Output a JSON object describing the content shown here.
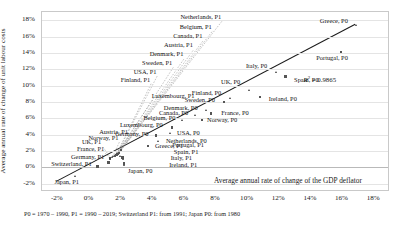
{
  "chart_data": {
    "type": "scatter",
    "title": "",
    "xlabel": "Average annual rate of change of the GDP deflator",
    "ylabel": "Average annual rate of change of unit labour costs",
    "xlim": [
      -3,
      19
    ],
    "ylim": [
      -3,
      19
    ],
    "xticks": [
      "-2%",
      "0%",
      "2%",
      "4%",
      "6%",
      "8%",
      "10%",
      "12%",
      "14%",
      "16%",
      "18%"
    ],
    "xtick_values": [
      -2,
      0,
      2,
      4,
      6,
      8,
      10,
      12,
      14,
      16,
      18
    ],
    "yticks": [
      "-2%",
      "0%",
      "2%",
      "4%",
      "6%",
      "8%",
      "10%",
      "12%",
      "14%",
      "16%",
      "18%"
    ],
    "ytick_values": [
      -2,
      0,
      2,
      4,
      6,
      8,
      10,
      12,
      14,
      16,
      18
    ],
    "grid": true,
    "legend": "none",
    "annotations": {
      "r_squared_label": "R",
      "r_squared_exp": "2",
      "r_squared_value": " = 0.9865"
    },
    "trendline": {
      "x0": -2.1,
      "y0": -1.7,
      "x1": 16.8,
      "y1": 17.5
    },
    "points": [
      {
        "label": "Greece, P0",
        "x": 16.9,
        "y": 17.4,
        "lx": 16.4,
        "ly": 17.8,
        "align": "right"
      },
      {
        "label": "Portugal, P0",
        "x": 15.9,
        "y": 14.1,
        "lx": 16.4,
        "ly": 13.3,
        "align": "right"
      },
      {
        "label": "Italy, P0",
        "x": 11.8,
        "y": 11.6,
        "lx": 11.3,
        "ly": 12.3,
        "align": "right"
      },
      {
        "label": "Spain, P0",
        "x": 12.4,
        "y": 11.1,
        "lx": 13.0,
        "ly": 10.6,
        "align": "left"
      },
      {
        "label": "UK, P0",
        "x": 10.1,
        "y": 9.4,
        "lx": 9.6,
        "ly": 10.3,
        "align": "right"
      },
      {
        "label": "Ireland, P0",
        "x": 10.8,
        "y": 8.6,
        "lx": 11.4,
        "ly": 8.2,
        "align": "left"
      },
      {
        "label": "Finland, P0",
        "x": 8.9,
        "y": 8.4,
        "lx": 8.4,
        "ly": 9.0,
        "align": "right"
      },
      {
        "label": "Sweden, P0",
        "x": 8.5,
        "y": 8.0,
        "lx": 8.0,
        "ly": 8.1,
        "align": "right"
      },
      {
        "label": "Denmark, P0",
        "x": 7.4,
        "y": 7.0,
        "lx": 6.9,
        "ly": 7.2,
        "align": "right"
      },
      {
        "label": "France, P0",
        "x": 7.7,
        "y": 6.6,
        "lx": 8.4,
        "ly": 6.5,
        "align": "left"
      },
      {
        "label": "Canada, P0",
        "x": 6.7,
        "y": 6.4,
        "lx": 6.3,
        "ly": 6.5,
        "align": "right"
      },
      {
        "label": "Norway, P0",
        "x": 7.1,
        "y": 5.8,
        "lx": 7.5,
        "ly": 5.7,
        "align": "left"
      },
      {
        "label": "Belgium, P0",
        "x": 5.9,
        "y": 5.7,
        "lx": 5.5,
        "ly": 5.9,
        "align": "right"
      },
      {
        "label": "Luxembourg, P0",
        "x": 5.2,
        "y": 4.9,
        "lx": 4.7,
        "ly": 5.1,
        "align": "right"
      },
      {
        "label": "USA, P0",
        "x": 5.1,
        "y": 4.2,
        "lx": 5.6,
        "ly": 4.1,
        "align": "left"
      },
      {
        "label": "Germany, P0",
        "x": 4.2,
        "y": 3.9,
        "lx": 3.8,
        "ly": 4.0,
        "align": "right"
      },
      {
        "label": "Netherlands, P0",
        "x": 4.4,
        "y": 3.2,
        "lx": 4.9,
        "ly": 3.1,
        "align": "left"
      },
      {
        "label": "Greece, P1",
        "x": 3.7,
        "y": 2.6,
        "lx": 4.2,
        "ly": 2.5,
        "align": "left"
      },
      {
        "label": "Japan, P0",
        "x": 2.2,
        "y": 0.2,
        "lx": 2.5,
        "ly": -0.6,
        "align": "left"
      },
      {
        "label": "Netherlands, P1",
        "x": 2.0,
        "y": 2.1,
        "lx": 8.4,
        "ly": 18.3,
        "align": "right"
      },
      {
        "label": "Belgium, P1",
        "x": 1.9,
        "y": 1.9,
        "lx": 7.8,
        "ly": 17.1,
        "align": "right"
      },
      {
        "label": "Canada, P1",
        "x": 1.85,
        "y": 1.8,
        "lx": 7.2,
        "ly": 15.9,
        "align": "right"
      },
      {
        "label": "Austria, P1",
        "x": 1.8,
        "y": 1.7,
        "lx": 6.6,
        "ly": 14.8,
        "align": "right"
      },
      {
        "label": "Denmark, P1",
        "x": 1.78,
        "y": 1.65,
        "lx": 6.0,
        "ly": 13.7,
        "align": "right"
      },
      {
        "label": "Sweden, P1",
        "x": 1.75,
        "y": 1.6,
        "lx": 5.3,
        "ly": 12.6,
        "align": "right"
      },
      {
        "label": "USA, P1",
        "x": 1.7,
        "y": 1.55,
        "lx": 4.3,
        "ly": 11.6,
        "align": "right"
      },
      {
        "label": "Finland, P1",
        "x": 1.68,
        "y": 1.5,
        "lx": 3.9,
        "ly": 10.6,
        "align": "right"
      },
      {
        "label": "Luxembourg, P1",
        "x": 1.6,
        "y": 1.4,
        "lx": 4.0,
        "ly": 8.6,
        "align": "left"
      },
      {
        "label": "Portugal, P1",
        "x": 2.0,
        "y": 1.3,
        "lx": 5.3,
        "ly": 2.6,
        "align": "left"
      },
      {
        "label": "Spain, P1",
        "x": 2.1,
        "y": 1.2,
        "lx": 5.4,
        "ly": 1.8,
        "align": "left"
      },
      {
        "label": "Italy, P1",
        "x": 2.15,
        "y": 1.0,
        "lx": 5.2,
        "ly": 1.0,
        "align": "left"
      },
      {
        "label": "Ireland, P1",
        "x": 2.2,
        "y": 0.5,
        "lx": 5.1,
        "ly": 0.2,
        "align": "left"
      },
      {
        "label": "Austria, P1 ",
        "x": 1.55,
        "y": 1.35,
        "lx": 2.5,
        "ly": 4.2,
        "align": "right"
      },
      {
        "label": "Germany, P1",
        "x": 1.2,
        "y": 0.6,
        "lx": 1.0,
        "ly": 1.2,
        "align": "right"
      },
      {
        "label": "Norway, P1",
        "x": 1.45,
        "y": 1.25,
        "lx": 1.9,
        "ly": 3.5,
        "align": "right"
      },
      {
        "label": "France, P1",
        "x": 1.3,
        "y": 1.1,
        "lx": 1.0,
        "ly": 2.1,
        "align": "right"
      },
      {
        "label": "UK, P1",
        "x": 1.35,
        "y": 1.15,
        "lx": 0.8,
        "ly": 3.0,
        "align": "right"
      },
      {
        "label": "Switzerland, P1",
        "x": 0.5,
        "y": 0.1,
        "lx": 0.2,
        "ly": 0.3,
        "align": "right"
      },
      {
        "label": "Japan, P1",
        "x": -0.9,
        "y": -1.1,
        "lx": -0.6,
        "ly": -1.9,
        "align": "right"
      }
    ]
  },
  "footnote": "P0 = 1970 – 1990, P1 = 1990 – 2019; Switzerland P1: from 1991; Japan P0: from 1980"
}
